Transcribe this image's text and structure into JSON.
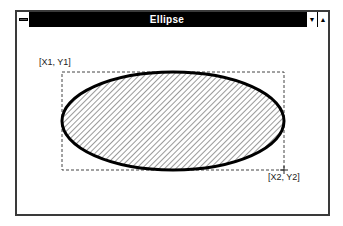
{
  "window": {
    "title": "Ellipse",
    "system_menu_icon": "system-menu-icon",
    "minimize_icon": "▼",
    "maximize_icon": "▲"
  },
  "canvas": {
    "label_top_left": "[X1, Y1]",
    "label_bottom_right": "[X2, Y2]",
    "shape": "ellipse",
    "fill_pattern": "diagonal-hatch",
    "colors": {
      "outline": "#000000",
      "hatch": "#555555",
      "bounding_box": "#444444",
      "titlebar": "#000000",
      "background": "#ffffff"
    }
  }
}
